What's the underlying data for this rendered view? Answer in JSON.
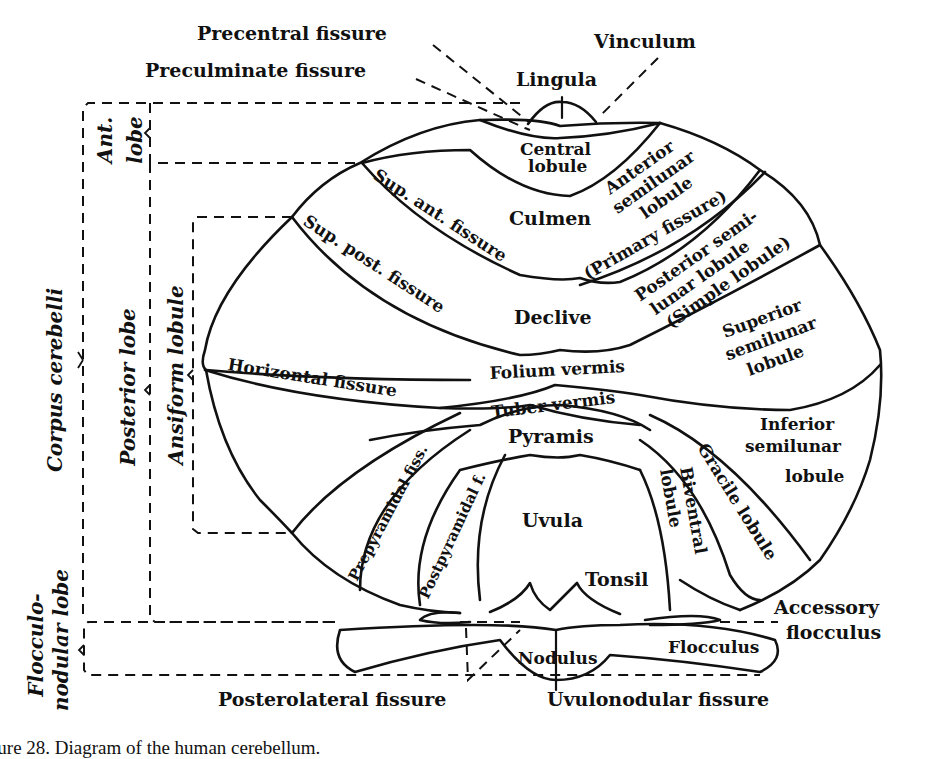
{
  "figure": {
    "caption": "Figure 28. Diagram of the human cerebellum."
  },
  "top_labels": {
    "precentral_fissure": "Precentral fissure",
    "preculminate_fissure": "Preculminate fissure",
    "vinculum": "Vinculum",
    "lingula": "Lingula"
  },
  "side_labels": {
    "ant_lobe_line1": "Ant.",
    "ant_lobe_line2": "lobe",
    "corpus_cerebelli": "Corpus cerebelli",
    "posterior_lobe": "Posterior lobe",
    "ansiform_lobule": "Ansiform lobule",
    "flocculonodular_line1": "Flocculo-",
    "flocculonodular_line2": "nodular lobe"
  },
  "regions": {
    "central_lobule_1": "Central",
    "central_lobule_2": "lobule",
    "culmen": "Culmen",
    "anterior_semilunar_1": "Anterior",
    "anterior_semilunar_2": "semilunar",
    "anterior_semilunar_3": "lobule",
    "declive": "Declive",
    "posterior_semilunar_1": "Posterior semi-",
    "posterior_semilunar_2": "lunar lobule",
    "posterior_semilunar_3": "(Simple lobule)",
    "superior_semilunar_1": "Superior",
    "superior_semilunar_2": "semilunar",
    "superior_semilunar_3": "lobule",
    "folium_vermis": "Folium vermis",
    "tuber_vermis": "Tuber vermis",
    "inferior_semilunar_1": "Inferior",
    "inferior_semilunar_2": "semilunar",
    "inferior_semilunar_3": "lobule",
    "pyramis": "Pyramis",
    "uvula": "Uvula",
    "tonsil": "Tonsil",
    "biventral_1": "Biventral",
    "biventral_2": "lobule",
    "gracile_lobule": "Gracile lobule",
    "nodulus": "Nodulus",
    "flocculus": "Flocculus"
  },
  "fissures": {
    "sup_ant_fissure": "Sup. ant. fissure",
    "sup_post_fissure": "Sup. post. fissure",
    "primary_fissure": "(Primary fissure)",
    "horizontal_fissure": "Horizontal fissure",
    "prepyramidal_fiss": "Prepyramidal fiss.",
    "postpyramidal_f": "Postpyramidal f."
  },
  "bottom_labels": {
    "accessory_flocculus_1": "Accessory",
    "accessory_flocculus_2": "flocculus",
    "posterolateral_fissure": "Posterolateral fissure",
    "uvulonodular_fissure": "Uvulonodular fissure"
  }
}
